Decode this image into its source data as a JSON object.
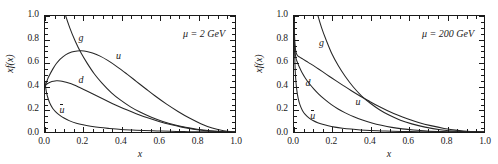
{
  "figure": {
    "background": "#ffffff",
    "ink": "#1a1a1a",
    "xlabel": "x",
    "ylabel_x": "x",
    "ylabel_f": "f(x)"
  },
  "panels": [
    {
      "id": "left",
      "annotation_mu": "μ",
      "annotation_eq": " = 2 ",
      "annotation_unit": "GeV",
      "annotation_full": "μ = 2 GeV",
      "curve_labels": [
        {
          "name": "g",
          "text": "g",
          "overbar": false,
          "x": 0.175,
          "y": 0.855
        },
        {
          "name": "u",
          "text": "u",
          "overbar": false,
          "x": 0.37,
          "y": 0.7
        },
        {
          "name": "d",
          "text": "d",
          "overbar": false,
          "x": 0.175,
          "y": 0.5
        },
        {
          "name": "ubar",
          "text": "u",
          "overbar": true,
          "x": 0.075,
          "y": 0.245
        }
      ]
    },
    {
      "id": "right",
      "annotation_mu": "μ",
      "annotation_eq": " = 200 ",
      "annotation_unit": "GeV",
      "annotation_full": "μ = 200 GeV",
      "curve_labels": [
        {
          "name": "g",
          "text": "g",
          "overbar": false,
          "x": 0.13,
          "y": 0.815
        },
        {
          "name": "d",
          "text": "d",
          "overbar": false,
          "x": 0.06,
          "y": 0.475
        },
        {
          "name": "u",
          "text": "u",
          "overbar": false,
          "x": 0.32,
          "y": 0.31
        },
        {
          "name": "ubar",
          "text": "u",
          "overbar": true,
          "x": 0.085,
          "y": 0.195
        }
      ]
    }
  ],
  "axes": {
    "xlim": [
      0.0,
      1.0
    ],
    "ylim": [
      0.0,
      1.0
    ],
    "xticks": [
      0.0,
      0.2,
      0.4,
      0.6,
      0.8,
      1.0
    ],
    "xticklabels": [
      "0.0",
      "0.2",
      "0.4",
      "0.6",
      "0.8",
      "1.0"
    ],
    "yticks": [
      0.0,
      0.2,
      0.4,
      0.6,
      0.8,
      1.0
    ],
    "yticklabels": [
      "0.0",
      "0.2",
      "0.4",
      "0.6",
      "0.8",
      "1.0"
    ],
    "minor_per_major": 4,
    "grid": false,
    "ticks_direction": "in",
    "ticks_all_sides": true
  },
  "chart_data": {
    "type": "line",
    "title": "",
    "subtitle": "",
    "xlabel": "x",
    "ylabel": "x f(x)",
    "xlim": [
      0.0,
      1.0
    ],
    "ylim": [
      0.0,
      1.0
    ],
    "grid": false,
    "legend": "inline curve labels",
    "panels": [
      {
        "name": "mu = 2 GeV",
        "annotation": "μ = 2 GeV",
        "series": [
          {
            "name": "g",
            "label": "g",
            "x": [
              0.0,
              0.005,
              0.01,
              0.02,
              0.03,
              0.05,
              0.07,
              0.1,
              0.13,
              0.16,
              0.19,
              0.22,
              0.26,
              0.3,
              0.35,
              0.4,
              0.45,
              0.5,
              0.56,
              0.62,
              0.68,
              0.74,
              0.8,
              0.87,
              0.93,
              1.0
            ],
            "y": [
              4.0,
              3.05,
              2.56,
              2.06,
              1.79,
              1.46,
              1.26,
              1.05,
              0.9,
              0.78,
              0.68,
              0.598,
              0.5,
              0.422,
              0.338,
              0.272,
              0.217,
              0.172,
              0.127,
              0.091,
              0.062,
              0.04,
              0.023,
              0.01,
              0.004,
              0.0
            ]
          },
          {
            "name": "u",
            "label": "u",
            "x": [
              0.0,
              0.01,
              0.02,
              0.04,
              0.06,
              0.08,
              0.11,
              0.14,
              0.17,
              0.19,
              0.22,
              0.25,
              0.29,
              0.33,
              0.38,
              0.43,
              0.48,
              0.53,
              0.58,
              0.64,
              0.7,
              0.76,
              0.82,
              0.88,
              0.94,
              1.0
            ],
            "y": [
              0.39,
              0.44,
              0.478,
              0.54,
              0.59,
              0.628,
              0.667,
              0.689,
              0.699,
              0.7,
              0.694,
              0.681,
              0.654,
              0.617,
              0.562,
              0.501,
              0.437,
              0.373,
              0.31,
              0.24,
              0.177,
              0.12,
              0.072,
              0.034,
              0.01,
              0.0
            ]
          },
          {
            "name": "d",
            "label": "d",
            "x": [
              0.0,
              0.008,
              0.016,
              0.03,
              0.045,
              0.06,
              0.08,
              0.1,
              0.125,
              0.15,
              0.18,
              0.215,
              0.25,
              0.29,
              0.335,
              0.38,
              0.43,
              0.48,
              0.54,
              0.6,
              0.66,
              0.72,
              0.79,
              0.86,
              0.93,
              1.0
            ],
            "y": [
              0.395,
              0.41,
              0.42,
              0.432,
              0.438,
              0.441,
              0.44,
              0.434,
              0.422,
              0.407,
              0.385,
              0.358,
              0.33,
              0.297,
              0.261,
              0.227,
              0.191,
              0.158,
              0.122,
              0.091,
              0.064,
              0.042,
              0.022,
              0.009,
              0.002,
              0.0
            ]
          },
          {
            "name": "ubar",
            "label": "ū",
            "x": [
              0.0,
              0.004,
              0.008,
              0.015,
              0.025,
              0.04,
              0.055,
              0.075,
              0.1,
              0.13,
              0.165,
              0.2,
              0.24,
              0.29,
              0.34,
              0.4,
              0.46,
              0.52,
              0.59,
              0.66,
              0.73,
              0.8,
              0.87,
              0.94,
              1.0
            ],
            "y": [
              0.43,
              0.378,
              0.34,
              0.295,
              0.25,
              0.205,
              0.176,
              0.147,
              0.12,
              0.096,
              0.076,
              0.062,
              0.05,
              0.038,
              0.03,
              0.022,
              0.017,
              0.013,
              0.009,
              0.006,
              0.004,
              0.002,
              0.001,
              0.0,
              0.0
            ]
          }
        ]
      },
      {
        "name": "mu = 200 GeV",
        "annotation": "μ = 200 GeV",
        "series": [
          {
            "name": "g",
            "label": "g",
            "x": [
              0.0,
              0.003,
              0.006,
              0.012,
              0.02,
              0.03,
              0.045,
              0.06,
              0.08,
              0.1,
              0.12,
              0.145,
              0.17,
              0.2,
              0.235,
              0.27,
              0.31,
              0.355,
              0.4,
              0.45,
              0.5,
              0.56,
              0.62,
              0.69,
              0.77,
              0.86,
              1.0
            ],
            "y": [
              8.5,
              6.1,
              4.9,
              3.7,
              2.95,
              2.42,
              1.94,
              1.66,
              1.39,
              1.19,
              1.04,
              0.9,
              0.79,
              0.672,
              0.566,
              0.478,
              0.392,
              0.312,
              0.25,
              0.192,
              0.146,
              0.102,
              0.07,
              0.042,
              0.02,
              0.007,
              0.0
            ]
          },
          {
            "name": "u",
            "label": "u",
            "x": [
              0.0,
              0.002,
              0.005,
              0.01,
              0.018,
              0.03,
              0.045,
              0.065,
              0.09,
              0.12,
              0.15,
              0.185,
              0.22,
              0.26,
              0.3,
              0.345,
              0.39,
              0.44,
              0.49,
              0.545,
              0.6,
              0.66,
              0.72,
              0.79,
              0.86,
              0.93,
              1.0
            ],
            "y": [
              1.0,
              0.87,
              0.76,
              0.69,
              0.66,
              0.645,
              0.63,
              0.61,
              0.585,
              0.553,
              0.52,
              0.481,
              0.443,
              0.4,
              0.358,
              0.313,
              0.271,
              0.226,
              0.186,
              0.146,
              0.112,
              0.08,
              0.055,
              0.031,
              0.014,
              0.004,
              0.0
            ]
          },
          {
            "name": "d",
            "label": "d",
            "x": [
              0.0,
              0.002,
              0.005,
              0.01,
              0.018,
              0.028,
              0.042,
              0.06,
              0.08,
              0.105,
              0.13,
              0.16,
              0.195,
              0.23,
              0.27,
              0.315,
              0.36,
              0.41,
              0.46,
              0.515,
              0.57,
              0.63,
              0.7,
              0.78,
              0.86,
              0.93,
              1.0
            ],
            "y": [
              1.0,
              0.82,
              0.7,
              0.64,
              0.6,
              0.56,
              0.512,
              0.463,
              0.418,
              0.37,
              0.327,
              0.283,
              0.238,
              0.201,
              0.165,
              0.131,
              0.103,
              0.078,
              0.058,
              0.04,
              0.027,
              0.017,
              0.009,
              0.004,
              0.001,
              0.0,
              0.0
            ]
          },
          {
            "name": "ubar",
            "label": "ū",
            "x": [
              0.0,
              0.002,
              0.004,
              0.008,
              0.014,
              0.022,
              0.032,
              0.045,
              0.06,
              0.08,
              0.1,
              0.125,
              0.15,
              0.18,
              0.215,
              0.255,
              0.3,
              0.35,
              0.4,
              0.46,
              0.52,
              0.59,
              0.66,
              0.74,
              0.83,
              0.92,
              1.0
            ],
            "y": [
              1.0,
              0.79,
              0.64,
              0.48,
              0.37,
              0.29,
              0.232,
              0.184,
              0.15,
              0.12,
              0.099,
              0.08,
              0.066,
              0.053,
              0.042,
              0.033,
              0.025,
              0.018,
              0.013,
              0.009,
              0.006,
              0.004,
              0.002,
              0.001,
              0.0,
              0.0,
              0.0
            ]
          }
        ]
      }
    ]
  }
}
